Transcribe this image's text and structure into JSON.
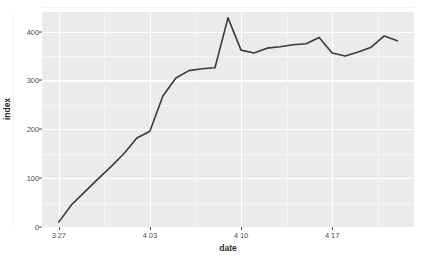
{
  "chart_data": {
    "type": "line",
    "title": "",
    "subtitle": "",
    "xlabel": "date",
    "ylabel": "index",
    "grid": true,
    "legend": false,
    "legend_position": "none",
    "theme": "ggplot2-grey",
    "panel_background": "#ebebeb",
    "grid_color": "#ffffff",
    "line_color": "#3a3a3a",
    "line_width": 1.6,
    "xlim": [
      "3 27",
      "4 22"
    ],
    "ylim": [
      0,
      440
    ],
    "y_ticks": [
      0,
      100,
      200,
      300,
      400
    ],
    "y_tick_labels": [
      "0",
      "100",
      "200",
      "300",
      "400"
    ],
    "x_ticks": [
      "3 27",
      "4 03",
      "4 10",
      "4 17"
    ],
    "x_tick_labels": [
      "3 27",
      "4 03",
      "4 10",
      "4 17"
    ],
    "x": [
      "3 27",
      "3 28",
      "3 29",
      "3 30",
      "3 31",
      "4 01",
      "4 02",
      "4 03",
      "4 04",
      "4 05",
      "4 06",
      "4 07",
      "4 08",
      "4 09",
      "4 10",
      "4 11",
      "4 12",
      "4 13",
      "4 14",
      "4 15",
      "4 16",
      "4 17",
      "4 18",
      "4 19",
      "4 20",
      "4 21",
      "4 22"
    ],
    "series": [
      {
        "name": "index",
        "values": [
          10,
          46,
          72,
          98,
          123,
          150,
          182,
          196,
          268,
          305,
          320,
          324,
          326,
          428,
          362,
          356,
          366,
          369,
          373,
          375,
          388,
          356,
          350,
          358,
          368,
          391,
          381
        ]
      }
    ]
  },
  "axes": {
    "x_title": "date",
    "y_title": "index"
  }
}
